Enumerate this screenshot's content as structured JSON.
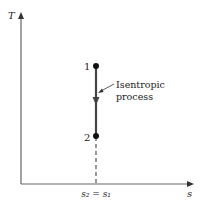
{
  "diagram": {
    "type": "T-s diagram",
    "axes": {
      "y_label": "T",
      "x_label": "s"
    },
    "points": [
      {
        "label": "1"
      },
      {
        "label": "2"
      }
    ],
    "process_label_line1": "Isentropic",
    "process_label_line2": "process",
    "x_tick_label": "s₂ = s₁",
    "colors": {
      "axis": "#555555",
      "process_line": "#444444",
      "points": "#111111"
    }
  }
}
